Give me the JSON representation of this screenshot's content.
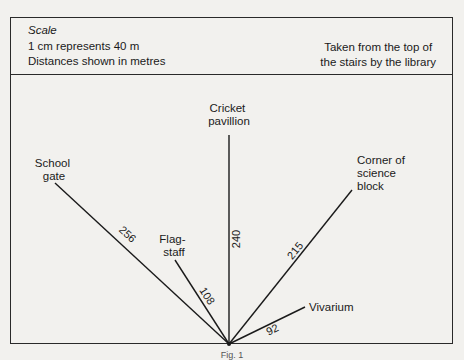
{
  "header": {
    "scale_title": "Scale",
    "scale_line1": "1 cm represents 40 m",
    "scale_line2": "Distances shown in metres",
    "taken_from_line1": "Taken from the top of",
    "taken_from_line2": "the stairs by the library"
  },
  "diagram": {
    "origin": "Top of the stairs by the library",
    "bearings": [
      {
        "label_lines": [
          "School",
          "gate"
        ],
        "distance": "256"
      },
      {
        "label_lines": [
          "Flag-",
          "staff"
        ],
        "distance": "108"
      },
      {
        "label_lines": [
          "Cricket",
          "pavillion"
        ],
        "distance": "240"
      },
      {
        "label_lines": [
          "Corner of",
          "science",
          "block"
        ],
        "distance": "215"
      },
      {
        "label_lines": [
          "Vivarium"
        ],
        "distance": "92"
      }
    ]
  },
  "caption": "Fig. 1",
  "colors": {
    "ink": "#1a1a1a",
    "paper": "#f2f1ee"
  }
}
